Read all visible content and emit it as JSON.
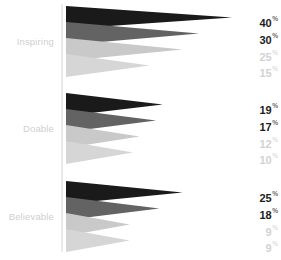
{
  "chart_data": {
    "type": "bar",
    "title": "",
    "subtitle": "",
    "xlabel": "",
    "ylabel": "",
    "grid": false,
    "legend_position": "none",
    "orientation": "horizontal",
    "marker_shape": "right-pointing-triangle-pennant",
    "axis_line_color": "#e9e9e9",
    "background_color": "#ffffff",
    "categories": [
      "Inspiring",
      "Doable",
      "Believable"
    ],
    "series": [
      {
        "name": "series-1",
        "color": "#1a1a1a",
        "values": [
          40,
          19,
          25
        ]
      },
      {
        "name": "series-2",
        "color": "#636363",
        "values": [
          30,
          17,
          18
        ]
      },
      {
        "name": "series-3",
        "color": "#c9c9c9",
        "values": [
          25,
          12,
          9
        ]
      },
      {
        "name": "series-4",
        "color": "#d6d6d6",
        "values": [
          15,
          10,
          9
        ]
      }
    ],
    "value_suffix": "%",
    "xlim": [
      0,
      40
    ],
    "groups": [
      {
        "label": "Inspiring",
        "rows": [
          {
            "value": "40",
            "suffix": "%",
            "emphasis": "strong",
            "color": "#1a1a1a"
          },
          {
            "value": "30",
            "suffix": "%",
            "emphasis": "strong",
            "color": "#636363"
          },
          {
            "value": "25",
            "suffix": "%",
            "emphasis": "faint",
            "color": "#c9c9c9"
          },
          {
            "value": "15",
            "suffix": "%",
            "emphasis": "faint",
            "color": "#d6d6d6"
          }
        ]
      },
      {
        "label": "Doable",
        "rows": [
          {
            "value": "19",
            "suffix": "%",
            "emphasis": "strong",
            "color": "#1a1a1a"
          },
          {
            "value": "17",
            "suffix": "%",
            "emphasis": "strong",
            "color": "#636363"
          },
          {
            "value": "12",
            "suffix": "%",
            "emphasis": "faint",
            "color": "#c9c9c9"
          },
          {
            "value": "10",
            "suffix": "%",
            "emphasis": "faint",
            "color": "#d6d6d6"
          }
        ]
      },
      {
        "label": "Believable",
        "rows": [
          {
            "value": "25",
            "suffix": "%",
            "emphasis": "strong",
            "color": "#1a1a1a"
          },
          {
            "value": "18",
            "suffix": "%",
            "emphasis": "strong",
            "color": "#636363"
          },
          {
            "value": "9",
            "suffix": "%",
            "emphasis": "faint",
            "color": "#c9c9c9"
          },
          {
            "value": "9",
            "suffix": "%",
            "emphasis": "faint",
            "color": "#d6d6d6"
          }
        ]
      }
    ]
  },
  "layout": {
    "axis_x": 61,
    "pennant_start_x": 66,
    "max_length_px": 166,
    "max_value": 40,
    "min_length_px": 34,
    "group_tops": [
      6,
      93,
      181
    ],
    "row_step": 16,
    "pennant_height": 23,
    "label_rows_y": [
      [
        14,
        31,
        48,
        64
      ],
      [
        101,
        118,
        135,
        151
      ],
      [
        189,
        206,
        223,
        239
      ]
    ],
    "category_label_y": [
      36,
      123,
      211
    ]
  }
}
